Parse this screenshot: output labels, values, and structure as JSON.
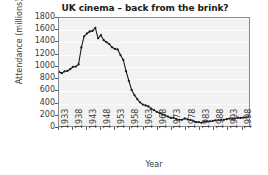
{
  "chart_data": {
    "type": "line",
    "title": "UK cinema – back from the brink?",
    "xlabel": "Year",
    "ylabel": "Attendance (millions)",
    "xlim": [
      1933,
      2001
    ],
    "ylim": [
      0,
      1800
    ],
    "grid": true,
    "legend": false,
    "marker": "filled-circle",
    "line_color": "#1a1a1a",
    "plot_background": "#f2f2f2",
    "y_ticks": [
      0,
      200,
      400,
      600,
      800,
      1000,
      1200,
      1400,
      1600,
      1800
    ],
    "x_ticks": [
      1933,
      1938,
      1943,
      1948,
      1953,
      1958,
      1963,
      1968,
      1973,
      1978,
      1983,
      1988,
      1993,
      1998
    ],
    "x": [
      1933,
      1934,
      1935,
      1936,
      1937,
      1938,
      1939,
      1940,
      1941,
      1942,
      1943,
      1944,
      1945,
      1946,
      1947,
      1948,
      1949,
      1950,
      1951,
      1952,
      1953,
      1954,
      1955,
      1956,
      1957,
      1958,
      1959,
      1960,
      1961,
      1962,
      1963,
      1964,
      1965,
      1966,
      1967,
      1968,
      1969,
      1970,
      1971,
      1972,
      1973,
      1974,
      1975,
      1976,
      1977,
      1978,
      1979,
      1980,
      1981,
      1982,
      1983,
      1984,
      1985,
      1986,
      1987,
      1988,
      1989,
      1990,
      1991,
      1992,
      1993,
      1994,
      1995,
      1996,
      1997,
      1998,
      1999,
      2000,
      2001
    ],
    "values": [
      903,
      880,
      912,
      917,
      946,
      987,
      990,
      1027,
      1309,
      1494,
      1541,
      1575,
      1585,
      1635,
      1462,
      1514,
      1430,
      1396,
      1365,
      1312,
      1285,
      1276,
      1182,
      1101,
      915,
      754,
      601,
      515,
      449,
      395,
      357,
      342,
      327,
      289,
      265,
      237,
      215,
      193,
      176,
      157,
      134,
      138,
      116,
      104,
      103,
      126,
      112,
      101,
      86,
      64,
      66,
      54,
      73,
      76,
      79,
      84,
      95,
      97,
      100,
      104,
      114,
      124,
      115,
      124,
      139,
      135,
      140,
      143,
      156
    ]
  }
}
